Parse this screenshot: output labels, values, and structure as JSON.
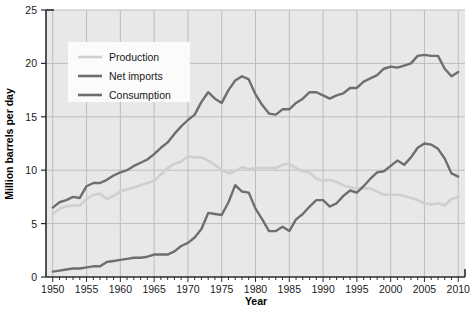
{
  "chart_data": {
    "type": "line",
    "title": "",
    "xlabel": "Year",
    "ylabel": "Million barrels per day",
    "xlim": [
      1949,
      2011
    ],
    "ylim": [
      0,
      25
    ],
    "xticks": [
      1950,
      1955,
      1960,
      1965,
      1970,
      1975,
      1980,
      1985,
      1990,
      1995,
      2000,
      2005,
      2010
    ],
    "yticks": [
      0,
      5,
      10,
      15,
      20,
      25
    ],
    "grid": true,
    "legend_position": "top-left",
    "colors": {
      "production": "#cfcfcf",
      "net_imports": "#6e6e6e",
      "consumption": "#6e6e6e",
      "plot_background": "#e8e8e8",
      "gridline": "#bdbdbd",
      "axis": "#2a2a2a",
      "legend_background": "#fbfbfb"
    },
    "x": [
      1950,
      1951,
      1952,
      1953,
      1954,
      1955,
      1956,
      1957,
      1958,
      1959,
      1960,
      1961,
      1962,
      1963,
      1964,
      1965,
      1966,
      1967,
      1968,
      1969,
      1970,
      1971,
      1972,
      1973,
      1974,
      1975,
      1976,
      1977,
      1978,
      1979,
      1980,
      1981,
      1982,
      1983,
      1984,
      1985,
      1986,
      1987,
      1988,
      1989,
      1990,
      1991,
      1992,
      1993,
      1994,
      1995,
      1996,
      1997,
      1998,
      1999,
      2000,
      2001,
      2002,
      2003,
      2004,
      2005,
      2006,
      2007,
      2008,
      2009,
      2010
    ],
    "series": [
      {
        "name": "Production",
        "color": "#cfcfcf",
        "values": [
          5.9,
          6.4,
          6.6,
          6.7,
          6.7,
          7.3,
          7.7,
          7.8,
          7.3,
          7.6,
          8.0,
          8.2,
          8.4,
          8.6,
          8.8,
          9.0,
          9.6,
          10.2,
          10.6,
          10.8,
          11.3,
          11.2,
          11.2,
          10.9,
          10.5,
          10.0,
          9.7,
          9.9,
          10.3,
          10.1,
          10.2,
          10.2,
          10.2,
          10.2,
          10.5,
          10.6,
          10.2,
          9.9,
          9.8,
          9.2,
          9.0,
          9.1,
          8.9,
          8.6,
          8.4,
          8.3,
          8.3,
          8.3,
          8.0,
          7.7,
          7.7,
          7.7,
          7.6,
          7.4,
          7.2,
          6.9,
          6.8,
          6.9,
          6.7,
          7.3,
          7.5
        ]
      },
      {
        "name": "Net imports",
        "color": "#6e6e6e",
        "values": [
          0.5,
          0.6,
          0.7,
          0.8,
          0.8,
          0.9,
          1.0,
          1.0,
          1.4,
          1.5,
          1.6,
          1.7,
          1.8,
          1.8,
          1.9,
          2.1,
          2.1,
          2.1,
          2.4,
          2.9,
          3.2,
          3.7,
          4.5,
          6.0,
          5.9,
          5.8,
          7.0,
          8.6,
          8.0,
          7.9,
          6.4,
          5.4,
          4.3,
          4.3,
          4.7,
          4.3,
          5.4,
          5.9,
          6.6,
          7.2,
          7.2,
          6.6,
          6.9,
          7.6,
          8.1,
          7.9,
          8.5,
          9.2,
          9.8,
          9.9,
          10.4,
          10.9,
          10.5,
          11.2,
          12.1,
          12.5,
          12.4,
          12.0,
          11.1,
          9.7,
          9.4
        ]
      },
      {
        "name": "Consumption",
        "color": "#6e6e6e",
        "values": [
          6.5,
          7.0,
          7.2,
          7.5,
          7.4,
          8.5,
          8.8,
          8.8,
          9.1,
          9.5,
          9.8,
          10.0,
          10.4,
          10.7,
          11.0,
          11.5,
          12.1,
          12.6,
          13.4,
          14.1,
          14.7,
          15.2,
          16.4,
          17.3,
          16.7,
          16.3,
          17.5,
          18.4,
          18.8,
          18.5,
          17.1,
          16.1,
          15.3,
          15.2,
          15.7,
          15.7,
          16.3,
          16.7,
          17.3,
          17.3,
          17.0,
          16.7,
          17.0,
          17.2,
          17.7,
          17.7,
          18.3,
          18.6,
          18.9,
          19.5,
          19.7,
          19.6,
          19.8,
          20.0,
          20.7,
          20.8,
          20.7,
          20.7,
          19.5,
          18.8,
          19.2
        ]
      }
    ]
  },
  "axes": {
    "x_tick_labels": [
      "1950",
      "1955",
      "1960",
      "1965",
      "1970",
      "1975",
      "1980",
      "1985",
      "1990",
      "1995",
      "2000",
      "2005",
      "2010"
    ],
    "y_tick_labels": [
      "0",
      "5",
      "10",
      "15",
      "20",
      "25"
    ],
    "x_title": "Year",
    "y_title": "Million barrels per day"
  },
  "legend": {
    "items": [
      {
        "label": "Production",
        "color": "#cfcfcf"
      },
      {
        "label": "Net imports",
        "color": "#6e6e6e"
      },
      {
        "label": "Consumption",
        "color": "#6e6e6e"
      }
    ]
  }
}
